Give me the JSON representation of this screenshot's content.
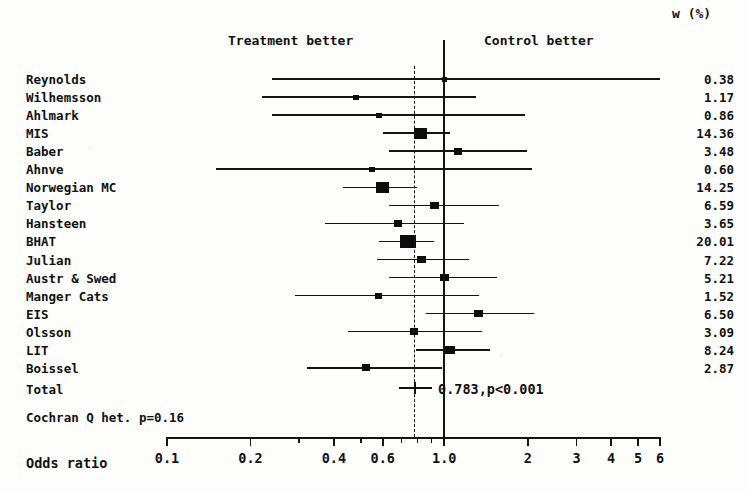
{
  "chart_data": {
    "type": "scatter",
    "plot_kind": "forest-plot",
    "title": "",
    "xlabel": "Odds ratio",
    "ylabel": "",
    "xscale": "log",
    "xlim": [
      0.1,
      6
    ],
    "xticks": [
      0.1,
      0.2,
      0.4,
      0.6,
      1.0,
      2,
      3,
      4,
      5,
      6
    ],
    "xtick_labels": [
      "0.1",
      "0.2",
      "0.4",
      "0.6",
      "1.0",
      "2",
      "3",
      "4",
      "5",
      "6"
    ],
    "minor_xticks": [
      0.3,
      0.5,
      0.7,
      0.8,
      0.9
    ],
    "grid": false,
    "reference_line": 1.0,
    "pooled_line": 0.783,
    "legend_position": "none",
    "left_region_label": "Treatment better",
    "right_region_label": "Control better",
    "weight_column_header": "w (%)",
    "studies": [
      {
        "name": "Reynolds",
        "or": 1.0,
        "ci_low": 0.24,
        "ci_high": 6.0,
        "weight": "0.38",
        "weight_num": 0.38,
        "marker_px": 5
      },
      {
        "name": "Wilhemsson",
        "or": 0.48,
        "ci_low": 0.22,
        "ci_high": 1.3,
        "weight": "1.17",
        "weight_num": 1.17,
        "marker_px": 6
      },
      {
        "name": "Ahlmark",
        "or": 0.58,
        "ci_low": 0.24,
        "ci_high": 1.95,
        "weight": "0.86",
        "weight_num": 0.86,
        "marker_px": 6
      },
      {
        "name": "MIS",
        "or": 0.82,
        "ci_low": 0.6,
        "ci_high": 1.05,
        "weight": "14.36",
        "weight_num": 14.36,
        "marker_px": 13
      },
      {
        "name": "Baber",
        "or": 1.12,
        "ci_low": 0.63,
        "ci_high": 1.99,
        "weight": "3.48",
        "weight_num": 3.48,
        "marker_px": 8
      },
      {
        "name": "Ahnve",
        "or": 0.55,
        "ci_low": 0.15,
        "ci_high": 2.08,
        "weight": "0.60",
        "weight_num": 0.6,
        "marker_px": 6
      },
      {
        "name": "Norwegian MC",
        "or": 0.6,
        "ci_low": 0.43,
        "ci_high": 0.8,
        "weight": "14.25",
        "weight_num": 14.25,
        "marker_px": 13
      },
      {
        "name": "Taylor",
        "or": 0.92,
        "ci_low": 0.63,
        "ci_high": 1.57,
        "weight": "6.59",
        "weight_num": 6.59,
        "marker_px": 9
      },
      {
        "name": "Hansteen",
        "or": 0.68,
        "ci_low": 0.37,
        "ci_high": 1.18,
        "weight": "3.65",
        "weight_num": 3.65,
        "marker_px": 8
      },
      {
        "name": "BHAT",
        "or": 0.74,
        "ci_low": 0.58,
        "ci_high": 0.92,
        "weight": "20.01",
        "weight_num": 20.01,
        "marker_px": 16
      },
      {
        "name": "Julian",
        "or": 0.83,
        "ci_low": 0.57,
        "ci_high": 1.23,
        "weight": "7.22",
        "weight_num": 7.22,
        "marker_px": 9
      },
      {
        "name": "Austr & Swed",
        "or": 1.0,
        "ci_low": 0.63,
        "ci_high": 1.55,
        "weight": "5.21",
        "weight_num": 5.21,
        "marker_px": 9
      },
      {
        "name": "Manger Cats",
        "or": 0.58,
        "ci_low": 0.29,
        "ci_high": 1.33,
        "weight": "1.52",
        "weight_num": 1.52,
        "marker_px": 7
      },
      {
        "name": "EIS",
        "or": 1.33,
        "ci_low": 0.86,
        "ci_high": 2.1,
        "weight": "6.50",
        "weight_num": 6.5,
        "marker_px": 9
      },
      {
        "name": "Olsson",
        "or": 0.78,
        "ci_low": 0.45,
        "ci_high": 1.37,
        "weight": "3.09",
        "weight_num": 3.09,
        "marker_px": 8
      },
      {
        "name": "LIT",
        "or": 1.05,
        "ci_low": 0.79,
        "ci_high": 1.46,
        "weight": "8.24",
        "weight_num": 8.24,
        "marker_px": 10
      },
      {
        "name": "Boissel",
        "or": 0.52,
        "ci_low": 0.32,
        "ci_high": 0.98,
        "weight": "2.87",
        "weight_num": 2.87,
        "marker_px": 8
      }
    ],
    "total": {
      "label": "Total",
      "or": 0.783,
      "ci_low": 0.72,
      "ci_high": 0.86,
      "annotation": "0.783,p<0.001"
    },
    "heterogeneity": {
      "label": "Cochran Q het. p=0.16"
    }
  },
  "axis": {
    "title": "Odds ratio"
  },
  "colors": {
    "ink": "#141414",
    "paper": "#fdfdfb"
  }
}
